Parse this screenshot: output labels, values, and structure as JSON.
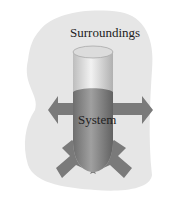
{
  "diagram": {
    "surroundings_label": "Surroundings",
    "system_label": "System",
    "colors": {
      "background": "#ffffff",
      "surroundings_fill": "#e6e6e6",
      "arrow_fill": "#7a7a7a",
      "cylinder_top": "#d8d8d8",
      "liquid": "#8c8c8c"
    },
    "arrows": [
      {
        "direction": "left"
      },
      {
        "direction": "right"
      },
      {
        "direction": "down-left"
      },
      {
        "direction": "down-right"
      }
    ]
  }
}
